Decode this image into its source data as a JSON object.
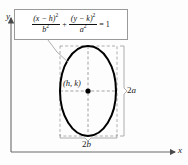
{
  "figure": {
    "type": "math-diagram",
    "equation": {
      "left_numerator_base": "(x − h)",
      "left_numerator_exp": "2",
      "left_denominator_base": "b",
      "left_denominator_exp": "2",
      "operator": "+",
      "right_numerator_base": "(y − k)",
      "right_numerator_exp": "2",
      "right_denominator_base": "a",
      "right_denominator_exp": "2",
      "equals": "= 1",
      "plain_text": "(x - h)^2 / b^2 + (y - k)^2 / a^2 = 1"
    },
    "axes": {
      "y_label": "y",
      "x_label": "x",
      "origin_px": [
        11,
        152
      ]
    },
    "center_label": "(h, k)",
    "dimension_vertical": {
      "number": "2",
      "variable": "a",
      "text": "2a"
    },
    "dimension_horizontal": {
      "number": "2",
      "variable": "b",
      "text": "2b"
    },
    "ellipse": {
      "center_px": [
        88,
        91
      ],
      "semi_axis_x_px": 28,
      "semi_axis_y_px": 45
    },
    "colors": {
      "curve": "#000000",
      "axis": "#6b6b6b",
      "dashed": "#8c8c8c",
      "box_border": "#9a9a9a",
      "background": "#fdfdfd",
      "text": "#1a1a1a"
    }
  }
}
